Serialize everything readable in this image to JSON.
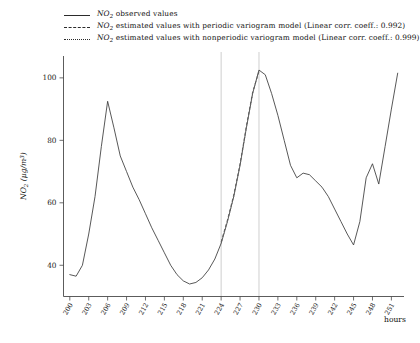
{
  "chart_data": {
    "type": "line",
    "title": "",
    "xlabel": "hours",
    "ylabel": "NO2 (ug/m3)",
    "ylabel_parts": {
      "species": "NO",
      "sub": "2",
      "unit": "(μg/m³)"
    },
    "xlim": [
      199,
      253
    ],
    "ylim": [
      30,
      107
    ],
    "yticks": [
      40,
      60,
      80,
      100
    ],
    "xticks": [
      200,
      203,
      206,
      209,
      212,
      215,
      218,
      221,
      224,
      227,
      230,
      233,
      236,
      239,
      242,
      245,
      248,
      251
    ],
    "grid": false,
    "legend_position": "top-left-outside",
    "reference_lines": {
      "x": [
        224,
        230
      ],
      "color": "#c9c9c9",
      "label": "estimation-interval"
    },
    "series": [
      {
        "name": "NO2 observed values",
        "style": "solid",
        "color": "#3a3a3a",
        "x": [
          200,
          201,
          202,
          203,
          204,
          205,
          206,
          207,
          208,
          209,
          210,
          211,
          212,
          213,
          214,
          215,
          216,
          217,
          218,
          219,
          220,
          221,
          222,
          223,
          224,
          225,
          226,
          227,
          228,
          229,
          230,
          231,
          232,
          233,
          234,
          235,
          236,
          237,
          238,
          239,
          240,
          241,
          242,
          243,
          244,
          245,
          246,
          247,
          248,
          249,
          250,
          251,
          252
        ],
        "values": [
          37.0,
          36.5,
          40.0,
          50.0,
          62.0,
          78.0,
          92.5,
          84.0,
          75.0,
          70.0,
          65.0,
          61.0,
          56.5,
          52.0,
          48.0,
          44.0,
          40.0,
          37.0,
          35.0,
          34.0,
          34.5,
          36.0,
          38.5,
          42.0,
          47.0,
          54.0,
          62.0,
          72.0,
          84.0,
          95.0,
          102.5,
          101.0,
          95.0,
          88.0,
          80.0,
          72.0,
          68.0,
          69.5,
          69.0,
          67.0,
          65.0,
          62.0,
          58.0,
          54.0,
          50.0,
          46.5,
          54.0,
          68.0,
          72.5,
          66.0,
          78.0,
          90.0,
          101.5
        ]
      },
      {
        "name": "NO2 estimated values with periodic variogram model",
        "style": "dashed",
        "color": "#555555",
        "corr_coeff": 0.992,
        "x": [
          224,
          225,
          226,
          227,
          228,
          229,
          230
        ],
        "values": [
          47.5,
          54.5,
          62.5,
          72.5,
          84.5,
          95.5,
          102.0
        ]
      },
      {
        "name": "NO2 estimated values with nonperiodic variogram model",
        "style": "dotted",
        "color": "#666666",
        "corr_coeff": 0.999,
        "x": [
          224,
          225,
          226,
          227,
          228,
          229,
          230
        ],
        "values": [
          47.0,
          54.0,
          62.0,
          72.0,
          84.0,
          95.0,
          102.5
        ]
      }
    ]
  },
  "legend": {
    "items": [
      {
        "key": "solid",
        "species": "NO",
        "sub": "2",
        "text": " observed values",
        "name": "legend-observed"
      },
      {
        "key": "dashed",
        "species": "NO",
        "sub": "2",
        "text": " estimated values with periodic variogram model (Linear corr. coeff.: 0.992)",
        "name": "legend-periodic"
      },
      {
        "key": "dotted",
        "species": "NO",
        "sub": "2",
        "text": " estimated values with nonperiodic variogram model (Linear corr. coeff.: 0.999)",
        "name": "legend-nonperiodic"
      }
    ]
  },
  "axes": {
    "y_title_species": "NO",
    "y_title_sub": "2",
    "y_title_unit": "(μg/m³)",
    "x_title": "hours",
    "ytick_labels": [
      "100",
      "80",
      "60",
      "40"
    ],
    "xtick_labels": [
      "200",
      "203",
      "206",
      "209",
      "212",
      "215",
      "218",
      "221",
      "224",
      "227",
      "230",
      "233",
      "236",
      "239",
      "242",
      "245",
      "248",
      "251"
    ]
  }
}
